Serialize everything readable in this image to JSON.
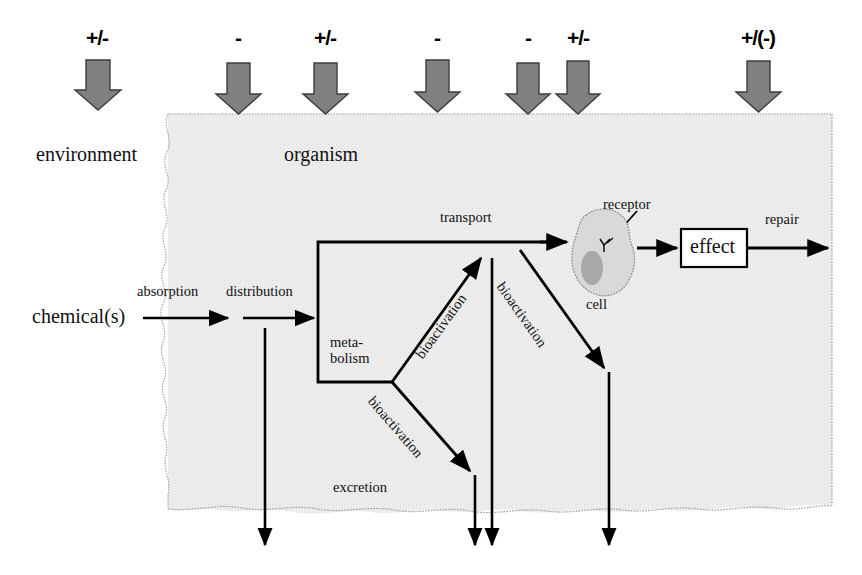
{
  "diagram": {
    "regions": {
      "environment_label": "environment",
      "organism_label": "organism"
    },
    "colors": {
      "organism_fill": "#ebebeb",
      "organism_edge": "#9a9a9a",
      "top_arrow_fill": "#808080",
      "top_arrow_edge": "#3a3a3a",
      "cell_fill": "#d9d9d9",
      "cell_edge": "#9a9a9a",
      "nucleus_fill": "#a8a8a8",
      "line": "#000000"
    },
    "top_modifiers": [
      {
        "sign": "+/-",
        "x": 97,
        "note": "environment input"
      },
      {
        "sign": "-",
        "x": 238,
        "note": "absorption"
      },
      {
        "sign": "+/-",
        "x": 325,
        "note": "distribution / metabolism"
      },
      {
        "sign": "-",
        "x": 437,
        "note": "transport"
      },
      {
        "sign": "-",
        "x": 528,
        "note": "bioactivation"
      },
      {
        "sign": "+/-",
        "x": 578,
        "note": "receptor binding"
      },
      {
        "sign": "+/(-)",
        "x": 758,
        "note": "repair"
      }
    ],
    "flow_labels": {
      "chemicals": "chemical(s)",
      "absorption": "absorption",
      "distribution": "distribution",
      "metabolism_line1": "meta-",
      "metabolism_line2": "bolism",
      "transport": "transport",
      "bioactivation_up": "bioactivation",
      "bioactivation_down": "bioactivation",
      "bioactivation_right": "bioactivation",
      "excretion": "excretion",
      "receptor": "receptor",
      "cell": "cell",
      "effect": "effect",
      "repair": "repair"
    }
  }
}
